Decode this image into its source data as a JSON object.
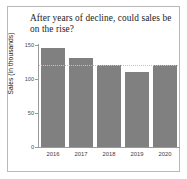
{
  "chart_data": {
    "type": "bar",
    "title": "After years of decline, could sales be on the rise?",
    "xlabel": "",
    "ylabel": "Sales (in thousands)",
    "categories": [
      "2016",
      "2017",
      "2018",
      "2019",
      "2020"
    ],
    "values": [
      145,
      131,
      120,
      110,
      120
    ],
    "ylim": [
      0,
      150
    ],
    "yticks": [
      0,
      50,
      100,
      150
    ],
    "ytick_labels": [
      "0",
      "50",
      "100",
      "150"
    ],
    "grid": false,
    "legend": null,
    "bar_color": "#808080",
    "reference_line": {
      "value": 120,
      "style": "dotted",
      "color": "#c4c4c4"
    },
    "annotations": []
  },
  "figure": {
    "background": "#ffffff",
    "border_color": "#b9b9b9",
    "axis_color": "#9a9a9a"
  }
}
